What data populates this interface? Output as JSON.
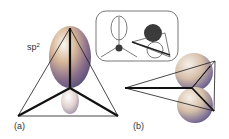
{
  "figure": {
    "panel_a": {
      "label": "(a)",
      "orbital_label_base": "sp",
      "orbital_label_sup": "2"
    },
    "panel_b": {
      "label": "(b)"
    },
    "colors": {
      "line": "#1a1a1a",
      "lobe_light": "#f4eee8",
      "lobe_warm": "#c89a72",
      "lobe_cool": "#6a5f86",
      "inset_border": "#555555",
      "inset_fill": "#3a3a3a"
    }
  }
}
